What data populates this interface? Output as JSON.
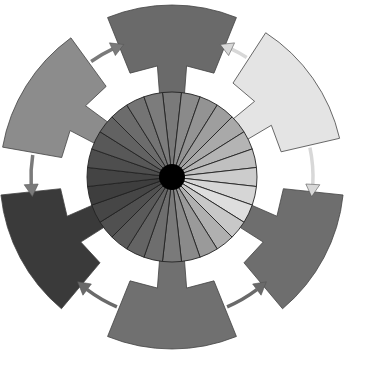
{
  "diagram": {
    "title": "",
    "center": [
      172,
      177
    ],
    "hub": {
      "radius": 13,
      "color": "#000000"
    },
    "disk": {
      "radius": 85,
      "wedge_count": 28,
      "stroke": "#222222"
    },
    "wedge_colors": [
      "#7a7a7a",
      "#8a8a8a",
      "#939393",
      "#9e9e9e",
      "#a9a9a9",
      "#b4b4b4",
      "#c0c0c0",
      "#cccccc",
      "#d6d6d6",
      "#dedede",
      "#c8c8c8",
      "#b0b0b0",
      "#9a9a9a",
      "#8a8a8a",
      "#7a7a7a",
      "#6e6e6e",
      "#646464",
      "#5a5a5a",
      "#505050",
      "#464646",
      "#3e3e3e",
      "#444444",
      "#4e4e4e",
      "#585858",
      "#626262",
      "#6c6c6c",
      "#747474",
      "#7c7c7c"
    ],
    "segments": [
      {
        "name": "top",
        "angle": -90,
        "color": "#6a6a6a"
      },
      {
        "name": "upper-right",
        "angle": -35,
        "color": "#e4e4e4"
      },
      {
        "name": "lower-right",
        "angle": 28,
        "color": "#6e6e6e"
      },
      {
        "name": "bottom",
        "angle": 90,
        "color": "#707070"
      },
      {
        "name": "lower-left",
        "angle": 152,
        "color": "#3a3a3a"
      },
      {
        "name": "upper-left",
        "angle": -148,
        "color": "#8c8c8c"
      }
    ],
    "arrows": [
      {
        "from": "upper-left",
        "to": "top",
        "color": "#7a7a7a"
      },
      {
        "from": "upper-right",
        "to": "top",
        "color": "#d8d8d8"
      },
      {
        "from": "upper-right",
        "to": "lower-right",
        "color": "#d8d8d8"
      },
      {
        "from": "bottom",
        "to": "lower-right",
        "color": "#6a6a6a"
      },
      {
        "from": "bottom",
        "to": "lower-left",
        "color": "#6a6a6a"
      },
      {
        "from": "upper-left",
        "to": "lower-left",
        "color": "#7a7a7a"
      }
    ]
  }
}
